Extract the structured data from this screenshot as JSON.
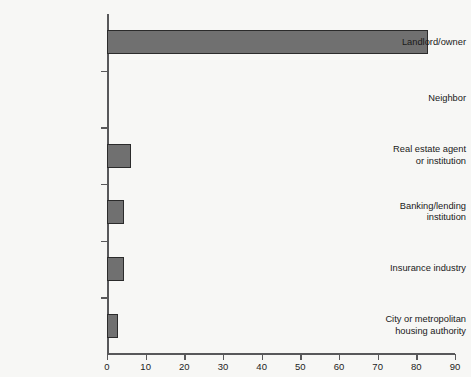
{
  "chart_data": {
    "type": "bar",
    "orientation": "horizontal",
    "title": "",
    "subtitle": "",
    "xlabel": "",
    "ylabel": "",
    "categories": [
      "Landlord/owner",
      "Neighbor",
      "Real estate agent or institution",
      "Banking/lending institution",
      "Insurance industry",
      "City or metropolitan housing authority"
    ],
    "category_label_lines": [
      [
        "Landlord/owner"
      ],
      [
        "Neighbor"
      ],
      [
        "Real estate agent",
        "or institution"
      ],
      [
        "Banking/lending",
        "institution"
      ],
      [
        "Insurance industry"
      ],
      [
        "City or metropolitan",
        "housing authority"
      ]
    ],
    "values": [
      83,
      0,
      6.3,
      4.4,
      4.4,
      2.8
    ],
    "xlim": [
      0,
      90
    ],
    "xticks": [
      0,
      10,
      20,
      30,
      40,
      50,
      60,
      70,
      80,
      90
    ],
    "xtick_labels": [
      "0",
      "10",
      "20",
      "30",
      "40",
      "50",
      "60",
      "70",
      "80",
      "90"
    ],
    "grid": false,
    "legend": null,
    "legend_position": "none",
    "bar_fill_color": "#707070",
    "bar_edge_color": "#2b2b2b",
    "axis_color": "#58585a",
    "background_color": "#f7f7f5",
    "annotations": []
  }
}
